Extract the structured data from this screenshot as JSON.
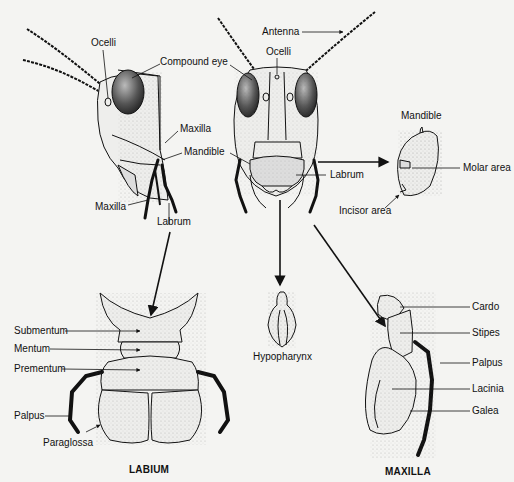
{
  "diagram": {
    "side_view": {
      "labels": {
        "ocelli": "Ocelli",
        "compound_eye": "Compound eye",
        "maxilla_upper": "Maxilla",
        "mandible": "Mandible",
        "maxilla_lower": "Maxilla",
        "labrum": "Labrum"
      }
    },
    "front_view": {
      "labels": {
        "antenna": "Antenna",
        "ocelli": "Ocelli",
        "labrum": "Labrum"
      }
    },
    "mandible_detail": {
      "labels": {
        "title": "Mandible",
        "molar_area": "Molar area",
        "incisor_area": "Incisor area"
      }
    },
    "hypopharynx": {
      "labels": {
        "name": "Hypopharynx"
      }
    },
    "labium": {
      "caption": "LABIUM",
      "labels": {
        "submentum": "Submentum",
        "mentum": "Mentum",
        "prementum": "Prementum",
        "palpus": "Palpus",
        "paraglossa": "Paraglossa"
      }
    },
    "maxilla": {
      "caption": "MAXILLA",
      "labels": {
        "cardo": "Cardo",
        "stipes": "Stipes",
        "palpus": "Palpus",
        "lacinia": "Lacinia",
        "galea": "Galea"
      }
    }
  }
}
